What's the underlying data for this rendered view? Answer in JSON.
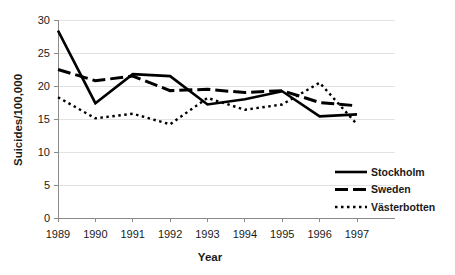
{
  "chart_data": {
    "type": "line",
    "title": "",
    "xlabel": "Year",
    "ylabel": "Suicides/100,000",
    "categories": [
      "1989",
      "1990",
      "1991",
      "1992",
      "1993",
      "1994",
      "1995",
      "1996",
      "1997"
    ],
    "x": [
      1989,
      1990,
      1991,
      1992,
      1993,
      1994,
      1995,
      1996,
      1997
    ],
    "xlim": [
      1989,
      1997
    ],
    "ylim": [
      0,
      30
    ],
    "yticks": [
      0,
      5,
      10,
      15,
      20,
      25,
      30
    ],
    "ytick_labels": [
      "0",
      "5",
      "10",
      "15",
      "20",
      "25",
      "30"
    ],
    "xtick_labels": [
      "1989",
      "1990",
      "1991",
      "1992",
      "1993",
      "1994",
      "1995",
      "1996",
      "1997"
    ],
    "grid": "horizontal",
    "legend_position": "lower-right",
    "series": [
      {
        "name": "Stockholm",
        "style": "solid",
        "color": "#000000",
        "values": [
          28.4,
          17.4,
          21.8,
          21.5,
          17.2,
          18.0,
          19.2,
          15.4,
          15.7
        ]
      },
      {
        "name": "Sweden",
        "style": "dashed",
        "color": "#000000",
        "values": [
          22.5,
          20.8,
          21.5,
          19.3,
          19.5,
          19.0,
          19.3,
          17.5,
          17.0
        ]
      },
      {
        "name": "Västerbotten",
        "style": "dotted",
        "color": "#000000",
        "values": [
          18.3,
          15.1,
          15.8,
          14.2,
          18.2,
          16.4,
          17.2,
          20.5,
          14.2
        ]
      }
    ]
  },
  "axes": {
    "y_title": "Suicides/100,000",
    "x_title": "Year"
  },
  "legend": {
    "items": [
      {
        "label": "Stockholm",
        "style": "solid"
      },
      {
        "label": "Sweden",
        "style": "dashed"
      },
      {
        "label": "Västerbotten",
        "style": "dotted"
      }
    ]
  }
}
